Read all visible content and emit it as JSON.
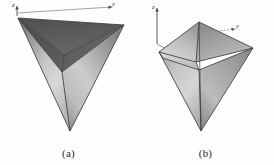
{
  "figure": {
    "background_color": "#fefefe",
    "panels": [
      {
        "id": "a",
        "caption": "(a)",
        "shape_name": "tetrahedron",
        "orientation": "apex-down, triangular top face visible",
        "axes": [
          {
            "name": "z",
            "label": "z",
            "direction": "up",
            "style": "solid"
          },
          {
            "name": "y",
            "label": "y",
            "direction": "right",
            "style": "solid"
          }
        ],
        "colors": {
          "top_face": "#5a5a5a",
          "top_face_dark": "#4d4d4d",
          "top_face_mid": "#636363",
          "left_face_dark": "#6e6e6e",
          "left_face_light": "#cfcfcf",
          "right_face_dark": "#8a8a8a",
          "right_face_light": "#d6d6d6",
          "edge": "#3c3c3c",
          "highlight": "#dcdcdc"
        }
      },
      {
        "id": "b",
        "caption": "(b)",
        "shape_name": "tetrahedron",
        "orientation": "apex-down, vertex-up rotated view",
        "axes": [
          {
            "name": "z",
            "label": "z",
            "direction": "up",
            "style": "solid"
          },
          {
            "name": "y",
            "label": "y",
            "direction": "right",
            "style": "dashed"
          }
        ],
        "colors": {
          "top_left_face": "#b9b9b9",
          "top_right_face": "#a3a3a3",
          "front_left_face": "#c2c2c2",
          "front_right_face": "#9e9e9e",
          "rim_face": "#d2d2d2",
          "edge": "#3c3c3c",
          "highlight": "#e2e2e2"
        }
      }
    ]
  }
}
